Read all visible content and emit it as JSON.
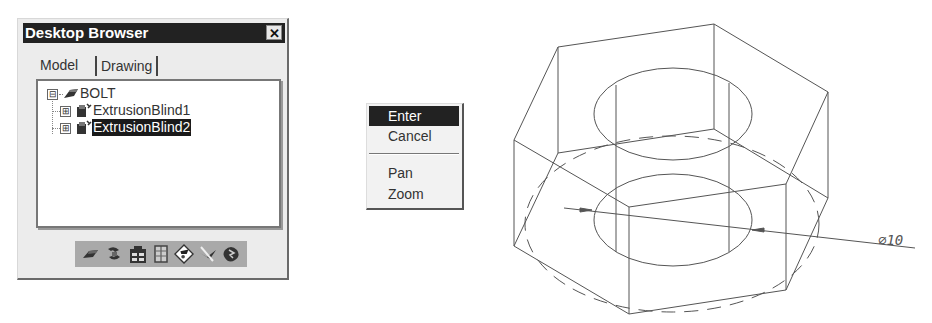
{
  "browser": {
    "title": "Desktop Browser",
    "close_icon": "close-icon",
    "tabs": [
      {
        "label": "Model",
        "active": true
      },
      {
        "label": "Drawing",
        "active": false
      }
    ],
    "tree": [
      {
        "label": "BOLT",
        "expander": "⊟",
        "icon": "part-icon",
        "level": 0,
        "selected": false
      },
      {
        "label": "ExtrusionBlind1",
        "expander": "⊞",
        "icon": "extrusion-feature-icon",
        "level": 1,
        "selected": false
      },
      {
        "label": "ExtrusionBlind2",
        "expander": "⊞",
        "icon": "extrusion-feature-icon",
        "level": 1,
        "selected": true
      }
    ],
    "toolbar": [
      {
        "icon": "part-icon"
      },
      {
        "icon": "assembly-icon"
      },
      {
        "icon": "catalog-icon"
      },
      {
        "icon": "table-icon"
      },
      {
        "icon": "drawing-icon"
      },
      {
        "icon": "sketch-icon"
      },
      {
        "icon": "scene-icon"
      }
    ]
  },
  "context_menu": {
    "items": [
      {
        "label": "Enter",
        "active": true
      },
      {
        "label": "Cancel",
        "active": false
      },
      {
        "separator": true
      },
      {
        "label": "Pan",
        "active": false
      },
      {
        "label": "Zoom",
        "active": false
      }
    ]
  },
  "drawing": {
    "dimension_label": "⌀10",
    "line_color": "#555555"
  }
}
